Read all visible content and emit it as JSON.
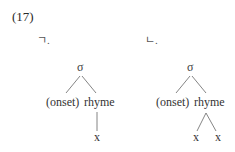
{
  "example": {
    "number": "(17)",
    "trees": [
      {
        "label": "ㄱ.",
        "root": "σ",
        "children": [
          "(onset)",
          "rhyme"
        ],
        "rhyme_children": [
          "x"
        ]
      },
      {
        "label": "ㄴ.",
        "root": "σ",
        "children": [
          "(onset)",
          "rhyme"
        ],
        "rhyme_children": [
          "x",
          "x"
        ]
      }
    ]
  }
}
